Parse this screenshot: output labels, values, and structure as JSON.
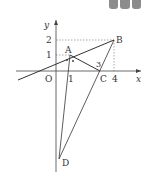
{
  "diagram": {
    "type": "coordinate-geometry",
    "axes": {
      "x_label": "x",
      "y_label": "y",
      "origin_label": "O"
    },
    "x_ticks": [
      "1",
      "4"
    ],
    "y_ticks": [
      "1",
      "2"
    ],
    "points": {
      "A": {
        "label": "A",
        "coords": [
          1,
          1
        ]
      },
      "B": {
        "label": "B",
        "coords": [
          4,
          2
        ]
      },
      "C": {
        "label": "C",
        "coords": [
          3,
          0
        ]
      },
      "D": {
        "label": "D",
        "coords": [
          0,
          -7
        ]
      }
    },
    "angle_label": "3",
    "segments": [
      "AB (extended line)",
      "AC",
      "BC",
      "BD",
      "AD"
    ]
  }
}
